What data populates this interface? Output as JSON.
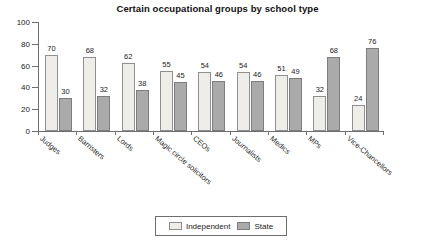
{
  "chart_data": {
    "type": "bar",
    "title": "Certain occupational groups by school type",
    "xlabel": "",
    "ylabel": "",
    "ylim": [
      0,
      100
    ],
    "yticks": [
      0,
      20,
      40,
      60,
      80,
      100
    ],
    "grid": false,
    "legend_position": "bottom-center",
    "categories": [
      "Judges",
      "Barristers",
      "Lords",
      "Magic circle solicitors",
      "CEOs",
      "Journalists",
      "Medics",
      "MPs",
      "Vice-Chancellors"
    ],
    "series": [
      {
        "name": "Independent",
        "color": "#eeede9",
        "values": [
          70,
          68,
          62,
          55,
          54,
          54,
          51,
          32,
          24
        ]
      },
      {
        "name": "State",
        "color": "#aaaaaa",
        "values": [
          30,
          32,
          38,
          45,
          46,
          46,
          49,
          68,
          76
        ]
      }
    ]
  }
}
